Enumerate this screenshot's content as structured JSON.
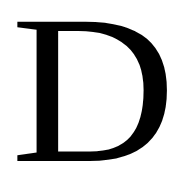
{
  "letter": {
    "char": "D",
    "color": "#000000",
    "background": "#ffffff"
  }
}
